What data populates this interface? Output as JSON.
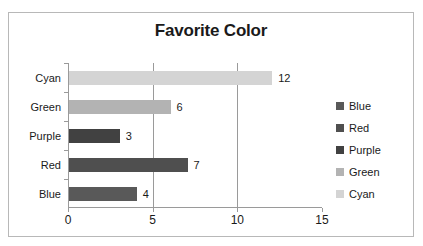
{
  "chart_data": {
    "type": "bar",
    "orientation": "horizontal",
    "title": "Favorite Color",
    "xlabel": "",
    "ylabel": "",
    "categories": [
      "Blue",
      "Red",
      "Purple",
      "Green",
      "Cyan"
    ],
    "values": [
      4,
      7,
      3,
      6,
      12
    ],
    "data_labels": [
      "4",
      "7",
      "3",
      "6",
      "12"
    ],
    "xlim": [
      0,
      15
    ],
    "xticks": [
      0,
      5,
      10,
      15
    ],
    "xtick_labels": [
      "0",
      "5",
      "10",
      "15"
    ],
    "grid": "vertical-major",
    "legend": {
      "position": "right",
      "entries": [
        {
          "label": "Blue",
          "color": "#595959"
        },
        {
          "label": "Red",
          "color": "#4f4f4f"
        },
        {
          "label": "Purple",
          "color": "#414141"
        },
        {
          "label": "Green",
          "color": "#b3b3b3"
        },
        {
          "label": "Cyan",
          "color": "#d4d4d4"
        }
      ]
    },
    "series": [
      {
        "name": "Favorite Color",
        "points": [
          {
            "category": "Blue",
            "value": 4,
            "label": "4",
            "color": "#595959"
          },
          {
            "category": "Red",
            "value": 7,
            "label": "7",
            "color": "#4f4f4f"
          },
          {
            "category": "Purple",
            "value": 3,
            "label": "3",
            "color": "#414141"
          },
          {
            "category": "Green",
            "value": 6,
            "label": "6",
            "color": "#b3b3b3"
          },
          {
            "category": "Cyan",
            "value": 12,
            "label": "12",
            "color": "#d4d4d4"
          }
        ]
      }
    ],
    "colors": {
      "axis": "#9a9a9a",
      "gridline": "#9a9a9a",
      "border": "#b8b8b8",
      "text": "#1a1a1a",
      "background": "#ffffff"
    }
  }
}
